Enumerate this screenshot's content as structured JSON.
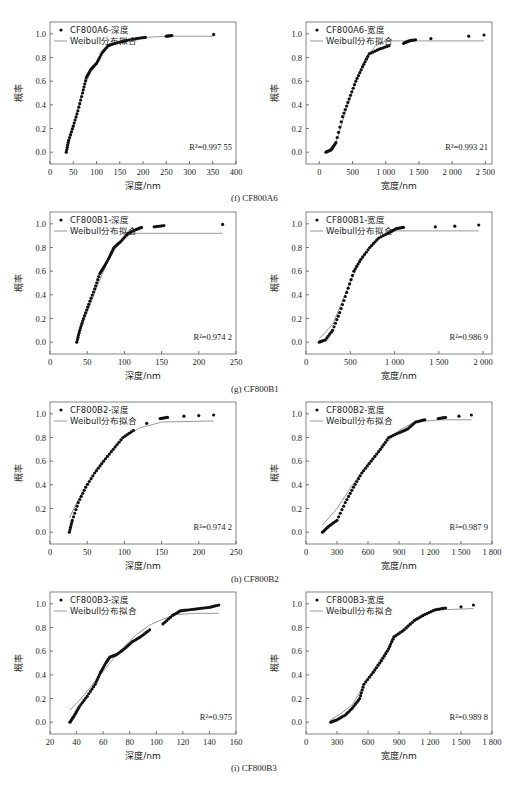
{
  "captions": [
    "(f) CF800A6",
    "(g) CF800B1",
    "(h) CF800B2",
    "(i) CF800B3"
  ],
  "ylabel": "概率",
  "fit_label": "Weibull分布拟合",
  "chart_data": [
    {
      "id": "A6-depth",
      "type": "scatter",
      "legend": "CF800A6-深度",
      "fit": "Weibull分布拟合",
      "xlabel": "深度/nm",
      "ylabel": "概率",
      "r2": "R²=0.997 55",
      "xlim": [
        0,
        400
      ],
      "ylim": [
        -0.1,
        1.1
      ],
      "xticks": [
        0,
        50,
        100,
        150,
        200,
        250,
        300,
        350,
        400
      ],
      "xticklabels": [
        "0",
        "50",
        "100",
        "150",
        "200",
        "250",
        "300",
        "350",
        "400"
      ],
      "yticks": [
        0,
        0.2,
        0.4,
        0.6,
        0.8,
        1.0
      ],
      "points": [
        [
          35,
          0
        ],
        [
          40,
          0.1
        ],
        [
          50,
          0.22
        ],
        [
          60,
          0.35
        ],
        [
          70,
          0.5
        ],
        [
          78,
          0.63
        ],
        [
          88,
          0.7
        ],
        [
          100,
          0.75
        ],
        [
          112,
          0.84
        ],
        [
          125,
          0.9
        ],
        [
          140,
          0.92
        ],
        [
          160,
          0.94
        ],
        [
          185,
          0.96
        ],
        [
          205,
          0.97
        ],
        [
          250,
          0.98
        ],
        [
          262,
          0.985
        ],
        [
          352,
          0.995
        ]
      ],
      "fit_curve": [
        [
          35,
          0
        ],
        [
          50,
          0.2
        ],
        [
          70,
          0.52
        ],
        [
          90,
          0.7
        ],
        [
          110,
          0.82
        ],
        [
          130,
          0.91
        ],
        [
          160,
          0.95
        ],
        [
          200,
          0.97
        ],
        [
          260,
          0.98
        ],
        [
          352,
          0.98
        ]
      ]
    },
    {
      "id": "A6-width",
      "type": "scatter",
      "legend": "CF800A6-宽度",
      "fit": "Weibull分布拟合",
      "xlabel": "宽度/nm",
      "ylabel": "概率",
      "r2": "R²=0.993 21",
      "xlim": [
        -200,
        2600
      ],
      "ylim": [
        -0.1,
        1.1
      ],
      "xticks": [
        0,
        500,
        1000,
        1500,
        2000,
        2500
      ],
      "xticklabels": [
        "0",
        "500",
        "1 000",
        "1 500",
        "2 000",
        "2 500"
      ],
      "yticks": [
        0,
        0.2,
        0.4,
        0.6,
        0.8,
        1.0
      ],
      "points": [
        [
          100,
          0
        ],
        [
          180,
          0.02
        ],
        [
          250,
          0.08
        ],
        [
          350,
          0.3
        ],
        [
          450,
          0.45
        ],
        [
          550,
          0.6
        ],
        [
          650,
          0.72
        ],
        [
          750,
          0.83
        ],
        [
          900,
          0.87
        ],
        [
          1050,
          0.9
        ],
        [
          1270,
          0.92
        ],
        [
          1350,
          0.94
        ],
        [
          1450,
          0.95
        ],
        [
          1680,
          0.96
        ],
        [
          2250,
          0.98
        ],
        [
          2480,
          0.99
        ]
      ],
      "fit_curve": [
        [
          100,
          0
        ],
        [
          250,
          0.08
        ],
        [
          400,
          0.35
        ],
        [
          550,
          0.6
        ],
        [
          700,
          0.8
        ],
        [
          850,
          0.9
        ],
        [
          1000,
          0.94
        ],
        [
          1500,
          0.94
        ],
        [
          2480,
          0.94
        ]
      ]
    },
    {
      "id": "B1-depth",
      "type": "scatter",
      "legend": "CF800B1-深度",
      "fit": "Weibull分布拟合",
      "xlabel": "深度/nm",
      "ylabel": "概率",
      "r2": "R²=0.974 2",
      "xlim": [
        0,
        250
      ],
      "ylim": [
        -0.1,
        1.1
      ],
      "xticks": [
        0,
        50,
        100,
        150,
        200,
        250
      ],
      "xticklabels": [
        "0",
        "50",
        "100",
        "150",
        "200",
        "250"
      ],
      "yticks": [
        0,
        0.2,
        0.4,
        0.6,
        0.8,
        1.0
      ],
      "points": [
        [
          36,
          0
        ],
        [
          40,
          0.1
        ],
        [
          45,
          0.2
        ],
        [
          52,
          0.32
        ],
        [
          60,
          0.45
        ],
        [
          67,
          0.58
        ],
        [
          73,
          0.64
        ],
        [
          80,
          0.72
        ],
        [
          86,
          0.8
        ],
        [
          95,
          0.85
        ],
        [
          105,
          0.92
        ],
        [
          115,
          0.95
        ],
        [
          123,
          0.97
        ],
        [
          140,
          0.975
        ],
        [
          153,
          0.985
        ],
        [
          232,
          0.995
        ]
      ],
      "fit_curve": [
        [
          36,
          0.05
        ],
        [
          50,
          0.25
        ],
        [
          65,
          0.5
        ],
        [
          80,
          0.72
        ],
        [
          95,
          0.86
        ],
        [
          110,
          0.92
        ],
        [
          150,
          0.92
        ],
        [
          232,
          0.92
        ]
      ]
    },
    {
      "id": "B1-width",
      "type": "scatter",
      "legend": "CF800B1-宽度",
      "fit": "Weibull分布拟合",
      "xlabel": "宽度/nm",
      "ylabel": "概率",
      "r2": "R²=0.986 9",
      "xlim": [
        0,
        2100
      ],
      "ylim": [
        -0.1,
        1.1
      ],
      "xticks": [
        0,
        500,
        1000,
        1500,
        2000
      ],
      "xticklabels": [
        "0",
        "500",
        "1 000",
        "1 500",
        "2 000"
      ],
      "yticks": [
        0,
        0.2,
        0.4,
        0.6,
        0.8,
        1.0
      ],
      "points": [
        [
          150,
          0
        ],
        [
          220,
          0.02
        ],
        [
          300,
          0.1
        ],
        [
          380,
          0.25
        ],
        [
          460,
          0.42
        ],
        [
          540,
          0.6
        ],
        [
          620,
          0.7
        ],
        [
          720,
          0.8
        ],
        [
          820,
          0.88
        ],
        [
          950,
          0.93
        ],
        [
          1020,
          0.96
        ],
        [
          1100,
          0.97
        ],
        [
          1460,
          0.975
        ],
        [
          1680,
          0.98
        ],
        [
          1950,
          0.99
        ]
      ],
      "fit_curve": [
        [
          150,
          0.03
        ],
        [
          300,
          0.15
        ],
        [
          450,
          0.42
        ],
        [
          600,
          0.67
        ],
        [
          750,
          0.83
        ],
        [
          900,
          0.92
        ],
        [
          1000,
          0.94
        ],
        [
          1500,
          0.94
        ],
        [
          1950,
          0.94
        ]
      ]
    },
    {
      "id": "B2-depth",
      "type": "scatter",
      "legend": "CF800B2-深度",
      "fit": "Weibull分布拟合",
      "xlabel": "深度/nm",
      "ylabel": "概率",
      "r2": "R²=0.974 2",
      "xlim": [
        0,
        250
      ],
      "ylim": [
        -0.1,
        1.1
      ],
      "xticks": [
        0,
        50,
        100,
        150,
        200,
        250
      ],
      "xticklabels": [
        "0",
        "50",
        "100",
        "150",
        "200",
        "250"
      ],
      "yticks": [
        0,
        0.2,
        0.4,
        0.6,
        0.8,
        1.0
      ],
      "points": [
        [
          26,
          0
        ],
        [
          30,
          0.1
        ],
        [
          38,
          0.25
        ],
        [
          48,
          0.38
        ],
        [
          60,
          0.5
        ],
        [
          72,
          0.6
        ],
        [
          85,
          0.7
        ],
        [
          98,
          0.8
        ],
        [
          112,
          0.86
        ],
        [
          130,
          0.92
        ],
        [
          148,
          0.96
        ],
        [
          158,
          0.97
        ],
        [
          180,
          0.98
        ],
        [
          200,
          0.985
        ],
        [
          220,
          0.99
        ]
      ],
      "fit_curve": [
        [
          26,
          0.12
        ],
        [
          40,
          0.3
        ],
        [
          60,
          0.5
        ],
        [
          80,
          0.67
        ],
        [
          100,
          0.8
        ],
        [
          120,
          0.88
        ],
        [
          150,
          0.93
        ],
        [
          220,
          0.94
        ]
      ]
    },
    {
      "id": "B2-width",
      "type": "scatter",
      "legend": "CF800B2-宽度",
      "fit": "Weibull分布拟合",
      "xlabel": "宽度/nm",
      "ylabel": "概率",
      "r2": "R²=0.987 9",
      "xlim": [
        0,
        1800
      ],
      "ylim": [
        -0.1,
        1.1
      ],
      "xticks": [
        0,
        300,
        600,
        900,
        1200,
        1500,
        1800
      ],
      "xticklabels": [
        "0",
        "300",
        "600",
        "900",
        "1 200",
        "1 500",
        "1 800"
      ],
      "yticks": [
        0,
        0.2,
        0.4,
        0.6,
        0.8,
        1.0
      ],
      "points": [
        [
          160,
          0
        ],
        [
          220,
          0.05
        ],
        [
          300,
          0.1
        ],
        [
          380,
          0.25
        ],
        [
          460,
          0.38
        ],
        [
          540,
          0.5
        ],
        [
          630,
          0.6
        ],
        [
          720,
          0.7
        ],
        [
          800,
          0.8
        ],
        [
          900,
          0.84
        ],
        [
          980,
          0.87
        ],
        [
          1060,
          0.93
        ],
        [
          1150,
          0.95
        ],
        [
          1280,
          0.96
        ],
        [
          1350,
          0.97
        ],
        [
          1480,
          0.98
        ],
        [
          1600,
          0.99
        ]
      ],
      "fit_curve": [
        [
          160,
          0.06
        ],
        [
          300,
          0.2
        ],
        [
          450,
          0.4
        ],
        [
          600,
          0.58
        ],
        [
          750,
          0.73
        ],
        [
          900,
          0.86
        ],
        [
          1050,
          0.93
        ],
        [
          1300,
          0.95
        ],
        [
          1600,
          0.95
        ]
      ]
    },
    {
      "id": "B3-depth",
      "type": "scatter",
      "legend": "CF800B3-深度",
      "fit": "Weibull分布拟合",
      "xlabel": "深度/nm",
      "ylabel": "概率",
      "r2": "R²=0.975",
      "xlim": [
        20,
        160
      ],
      "ylim": [
        -0.1,
        1.1
      ],
      "xticks": [
        20,
        40,
        60,
        80,
        100,
        120,
        140,
        160
      ],
      "xticklabels": [
        "20",
        "40",
        "60",
        "80",
        "100",
        "120",
        "140",
        "160"
      ],
      "yticks": [
        0,
        0.2,
        0.4,
        0.6,
        0.8,
        1.0
      ],
      "points": [
        [
          35,
          0
        ],
        [
          38,
          0.05
        ],
        [
          42,
          0.13
        ],
        [
          48,
          0.22
        ],
        [
          54,
          0.32
        ],
        [
          58,
          0.42
        ],
        [
          62,
          0.5
        ],
        [
          65,
          0.55
        ],
        [
          70,
          0.57
        ],
        [
          76,
          0.62
        ],
        [
          82,
          0.68
        ],
        [
          88,
          0.72
        ],
        [
          95,
          0.78
        ],
        [
          105,
          0.83
        ],
        [
          112,
          0.9
        ],
        [
          118,
          0.94
        ],
        [
          125,
          0.95
        ],
        [
          132,
          0.96
        ],
        [
          140,
          0.97
        ],
        [
          147,
          0.99
        ]
      ],
      "fit_curve": [
        [
          35,
          0.1
        ],
        [
          45,
          0.22
        ],
        [
          55,
          0.36
        ],
        [
          65,
          0.5
        ],
        [
          75,
          0.63
        ],
        [
          85,
          0.74
        ],
        [
          95,
          0.82
        ],
        [
          105,
          0.87
        ],
        [
          115,
          0.91
        ],
        [
          130,
          0.92
        ],
        [
          147,
          0.92
        ]
      ]
    },
    {
      "id": "B3-width",
      "type": "scatter",
      "legend": "CF800B3-宽度",
      "fit": "Weibull分布拟合",
      "xlabel": "宽度/nm",
      "ylabel": "概率",
      "r2": "R²=0.989 8",
      "xlim": [
        0,
        1800
      ],
      "ylim": [
        -0.1,
        1.1
      ],
      "xticks": [
        0,
        300,
        600,
        900,
        1200,
        1500,
        1800
      ],
      "xticklabels": [
        "0",
        "300",
        "600",
        "900",
        "1 200",
        "1 500",
        "1 800"
      ],
      "yticks": [
        0,
        0.2,
        0.4,
        0.6,
        0.8,
        1.0
      ],
      "points": [
        [
          240,
          0
        ],
        [
          300,
          0.02
        ],
        [
          380,
          0.06
        ],
        [
          450,
          0.12
        ],
        [
          520,
          0.2
        ],
        [
          560,
          0.32
        ],
        [
          650,
          0.42
        ],
        [
          730,
          0.52
        ],
        [
          800,
          0.62
        ],
        [
          850,
          0.72
        ],
        [
          950,
          0.78
        ],
        [
          1050,
          0.86
        ],
        [
          1150,
          0.91
        ],
        [
          1250,
          0.95
        ],
        [
          1350,
          0.965
        ],
        [
          1500,
          0.975
        ],
        [
          1620,
          0.99
        ]
      ],
      "fit_curve": [
        [
          240,
          0.02
        ],
        [
          350,
          0.08
        ],
        [
          450,
          0.15
        ],
        [
          550,
          0.3
        ],
        [
          650,
          0.44
        ],
        [
          750,
          0.57
        ],
        [
          850,
          0.7
        ],
        [
          950,
          0.8
        ],
        [
          1050,
          0.87
        ],
        [
          1150,
          0.92
        ],
        [
          1300,
          0.95
        ],
        [
          1620,
          0.96
        ]
      ]
    }
  ]
}
